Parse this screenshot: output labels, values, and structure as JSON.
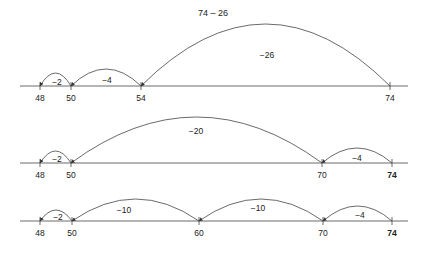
{
  "title": "74 – 26",
  "colors": {
    "line": "#444444",
    "text": "#222222",
    "background": "#ffffff"
  },
  "number_lines": [
    {
      "name": "number-line-1",
      "y": 86,
      "x_start": 20,
      "x_end": 408,
      "ticks": [
        {
          "value": "48",
          "x": 40,
          "bold": false
        },
        {
          "value": "50",
          "x": 71,
          "bold": false
        },
        {
          "value": "54",
          "x": 141,
          "bold": false
        },
        {
          "value": "74",
          "x": 390,
          "bold": false
        }
      ],
      "jumps": [
        {
          "label": "−26",
          "from_x": 390,
          "to_x": 141,
          "height": 62,
          "label_x": 267,
          "label_y": 58
        },
        {
          "label": "−4",
          "from_x": 141,
          "to_x": 71,
          "height": 17,
          "label_x": 107,
          "label_y": 83
        },
        {
          "label": "−2",
          "from_x": 71,
          "to_x": 40,
          "height": 13,
          "label_x": 57,
          "label_y": 85
        }
      ]
    },
    {
      "name": "number-line-2",
      "y": 163,
      "x_start": 20,
      "x_end": 408,
      "ticks": [
        {
          "value": "48",
          "x": 40,
          "bold": false
        },
        {
          "value": "50",
          "x": 71,
          "bold": false
        },
        {
          "value": "70",
          "x": 322,
          "bold": false
        },
        {
          "value": "74",
          "x": 392,
          "bold": true
        }
      ],
      "jumps": [
        {
          "label": "−20",
          "from_x": 322,
          "to_x": 71,
          "height": 46,
          "label_x": 196,
          "label_y": 134
        },
        {
          "label": "−4",
          "from_x": 392,
          "to_x": 322,
          "height": 15,
          "label_x": 357,
          "label_y": 161
        },
        {
          "label": "−2",
          "from_x": 71,
          "to_x": 40,
          "height": 12,
          "label_x": 57,
          "label_y": 162
        }
      ]
    },
    {
      "name": "number-line-3",
      "y": 221,
      "x_start": 20,
      "x_end": 408,
      "ticks": [
        {
          "value": "48",
          "x": 40,
          "bold": false
        },
        {
          "value": "50",
          "x": 72,
          "bold": false
        },
        {
          "value": "60",
          "x": 199,
          "bold": false
        },
        {
          "value": "70",
          "x": 323,
          "bold": false
        },
        {
          "value": "74",
          "x": 392,
          "bold": true
        }
      ],
      "jumps": [
        {
          "label": "−10",
          "from_x": 323,
          "to_x": 199,
          "height": 22,
          "label_x": 258,
          "label_y": 211
        },
        {
          "label": "−10",
          "from_x": 199,
          "to_x": 72,
          "height": 22,
          "label_x": 124,
          "label_y": 213
        },
        {
          "label": "−4",
          "from_x": 392,
          "to_x": 323,
          "height": 15,
          "label_x": 360,
          "label_y": 218
        },
        {
          "label": "−2",
          "from_x": 72,
          "to_x": 40,
          "height": 11,
          "label_x": 58,
          "label_y": 220
        }
      ]
    }
  ]
}
